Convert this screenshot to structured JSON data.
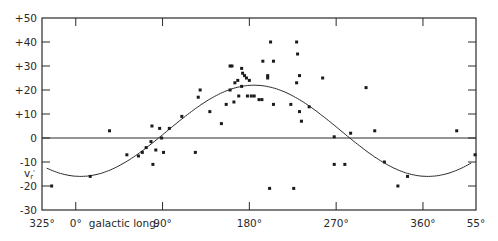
{
  "chart_data": {
    "type": "scatter",
    "title": "",
    "xlabel": "galactic long.",
    "ylabel": "v_r'",
    "x_tick_labels": [
      "325°",
      "0°",
      "90°",
      "180°",
      "270°",
      "360°",
      "55°"
    ],
    "x_tick_values": [
      -35,
      0,
      90,
      180,
      270,
      360,
      415
    ],
    "y_tick_labels": [
      "+50",
      "+40",
      "+30",
      "+20",
      "+10",
      "0",
      "-10",
      "-20",
      "-30"
    ],
    "y_tick_values": [
      50,
      40,
      30,
      20,
      10,
      0,
      -10,
      -20,
      -30
    ],
    "xlim": [
      -35,
      415
    ],
    "ylim": [
      -30,
      50
    ],
    "grid": false,
    "zero_line": true,
    "legend": null,
    "series": [
      {
        "name": "observed",
        "kind": "points",
        "x": [
          -25,
          15,
          35,
          53,
          65,
          69,
          73,
          78,
          79,
          80,
          83,
          87,
          89,
          91,
          97,
          110,
          124,
          127,
          129,
          139,
          151,
          156,
          160,
          162,
          160,
          165,
          168,
          172,
          173,
          164,
          169,
          172,
          175,
          177,
          180,
          178,
          182,
          185,
          190,
          193,
          194,
          202,
          205,
          199,
          199,
          201,
          205,
          223,
          226,
          229,
          230,
          232,
          229,
          232,
          234,
          242,
          256,
          268,
          268,
          279,
          285,
          301,
          310,
          320,
          334,
          344,
          395,
          414
        ],
        "y": [
          -20,
          -16,
          3,
          -7,
          -7.5,
          -6,
          -4,
          -1.5,
          5,
          -11,
          -5,
          4,
          0,
          -6,
          4,
          9,
          -6,
          17,
          20,
          11,
          6,
          14,
          30,
          30,
          20,
          23,
          24,
          29,
          27,
          15,
          17.5,
          21.5,
          26,
          25,
          24,
          17.5,
          17.5,
          17.5,
          16,
          16,
          32,
          40,
          32,
          26,
          25,
          -21,
          14,
          14,
          -21,
          40,
          35,
          26,
          23,
          11,
          7,
          13,
          25,
          0.5,
          -11,
          -11,
          2,
          21,
          3,
          -10,
          -20,
          -16,
          3,
          -7
        ]
      },
      {
        "name": "fitted sinusoid",
        "kind": "curve",
        "function": "v = 3 + 19*sin(l - 95°)",
        "amplitude": 19,
        "offset": 3,
        "phase_deg": 95,
        "x_range": [
          -30,
          410
        ]
      }
    ]
  }
}
